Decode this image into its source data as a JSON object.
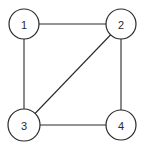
{
  "graph": {
    "nodes": [
      {
        "id": "1",
        "label": "1"
      },
      {
        "id": "2",
        "label": "2"
      },
      {
        "id": "3",
        "label": "3"
      },
      {
        "id": "4",
        "label": "4"
      }
    ],
    "edges": [
      {
        "from": "1",
        "to": "2"
      },
      {
        "from": "1",
        "to": "3"
      },
      {
        "from": "2",
        "to": "3"
      },
      {
        "from": "2",
        "to": "4"
      },
      {
        "from": "3",
        "to": "4"
      }
    ]
  },
  "colors": {
    "stroke": "#2a2a2a",
    "background": "#ffffff"
  }
}
